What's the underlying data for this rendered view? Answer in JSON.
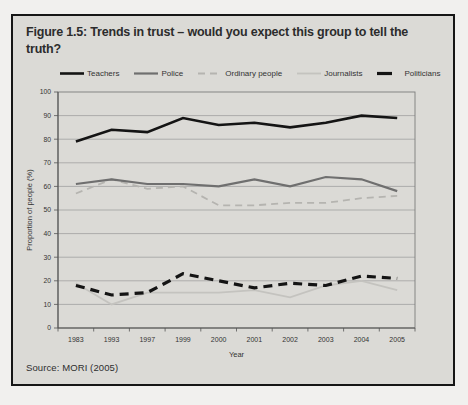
{
  "figure": {
    "title": "Figure 1.5: Trends in trust – would you expect this group to tell the truth?",
    "source": "Source: MORI (2005)"
  },
  "chart_data": {
    "type": "line",
    "title": "Figure 1.5: Trends in trust – would you expect this group to tell the truth?",
    "xlabel": "Year",
    "ylabel": "Proportion of people (%)",
    "ylim": [
      0,
      100
    ],
    "ytick_step": 10,
    "grid": true,
    "legend_position": "top",
    "categories": [
      "1983",
      "1993",
      "1997",
      "1999",
      "2000",
      "2001",
      "2002",
      "2003",
      "2004",
      "2005"
    ],
    "series": [
      {
        "name": "Teachers",
        "values": [
          79,
          84,
          83,
          89,
          86,
          87,
          85,
          87,
          90,
          89
        ],
        "color": "#141414",
        "width": 2.6,
        "dash": ""
      },
      {
        "name": "Police",
        "values": [
          61,
          63,
          61,
          61,
          60,
          63,
          60,
          64,
          63,
          58
        ],
        "color": "#6f6f6f",
        "width": 2.2,
        "dash": ""
      },
      {
        "name": "Ordinary people",
        "values": [
          57,
          63,
          59,
          60,
          52,
          52,
          53,
          53,
          55,
          56
        ],
        "color": "#b5b4b0",
        "width": 1.8,
        "dash": "7,5"
      },
      {
        "name": "Journalists",
        "values": [
          19,
          10,
          15,
          15,
          15,
          16,
          13,
          18,
          20,
          16
        ],
        "color": "#c4c3bf",
        "width": 1.8,
        "dash": ""
      },
      {
        "name": "Politicians",
        "values": [
          18,
          14,
          15,
          23,
          20,
          17,
          19,
          18,
          22,
          21
        ],
        "color": "#141414",
        "width": 3.2,
        "dash": "9,6"
      }
    ],
    "colors": {
      "figure_background": "#dbdad6",
      "grid": "#9a9a9a",
      "axis": "#555555",
      "text": "#333333"
    }
  }
}
